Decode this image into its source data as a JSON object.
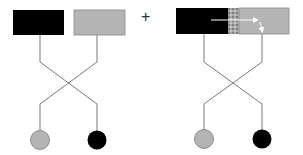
{
  "colors": {
    "black": "#000000",
    "gray": "#b4b4b4",
    "line": "#7a7a7a",
    "pattern": "#9a9a9a",
    "arrow": "#ffffff",
    "background": "#ffffff"
  },
  "operator": "+",
  "left_panel": {
    "blocks": [
      {
        "name": "black-block",
        "color": "black"
      },
      {
        "name": "gray-block",
        "color": "gray"
      }
    ],
    "circles": [
      {
        "name": "gray-circle",
        "color": "gray"
      },
      {
        "name": "black-circle",
        "color": "black"
      }
    ],
    "connections": "crossed"
  },
  "right_panel": {
    "fused_block": {
      "segments": [
        "black",
        "patterned-junction",
        "gray"
      ],
      "arrow": "white arrow from black segment through junction into gray segment, turning downward"
    },
    "circles": [
      {
        "name": "gray-circle",
        "color": "gray"
      },
      {
        "name": "black-circle",
        "color": "black"
      }
    ],
    "connections": "crossed"
  }
}
